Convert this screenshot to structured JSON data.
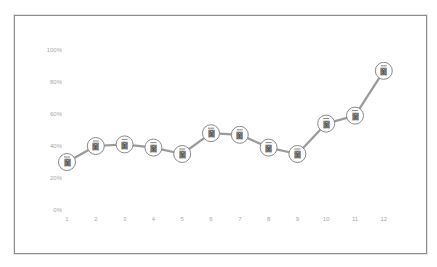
{
  "chart_data": {
    "type": "line",
    "title": "",
    "xlabel": "",
    "ylabel": "",
    "categories": [
      "1",
      "2",
      "3",
      "4",
      "5",
      "6",
      "7",
      "8",
      "9",
      "10",
      "11",
      "12"
    ],
    "series": [
      {
        "name": "Series 1",
        "values": [
          30,
          40,
          41,
          39,
          35,
          48,
          47,
          39,
          35,
          54,
          59,
          87
        ]
      }
    ],
    "y_ticks": [
      "0%",
      "20%",
      "40%",
      "60%",
      "80%",
      "100%"
    ],
    "ylim": [
      0,
      100
    ],
    "y_format": "percent",
    "grid": false,
    "legend": null,
    "marker": {
      "shape": "circle",
      "icon": "document-glyph-icon",
      "glyph": "圙"
    },
    "colors": {
      "line": "#9a9a9a",
      "marker_border": "#8a8a8a",
      "marker_fill": "#ffffff",
      "tick_label": "#a8a8a8",
      "frame": "#8c8c8c"
    }
  }
}
